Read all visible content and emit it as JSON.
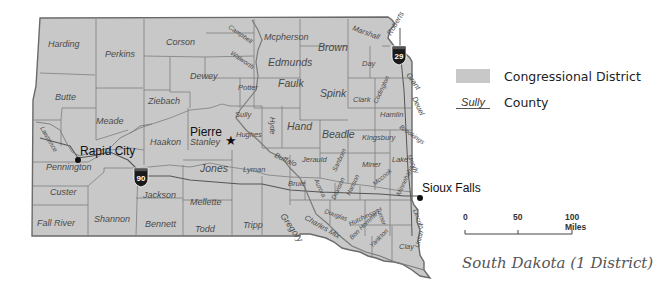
{
  "map": {
    "title": "South Dakota (1 District)",
    "fill_color": "#c8c8c8",
    "border_color": "#6a6a6a",
    "cities": [
      {
        "name": "Pierre",
        "symbol": "star",
        "capital": true
      },
      {
        "name": "Rapid City",
        "symbol": "dot"
      },
      {
        "name": "Sioux Falls",
        "symbol": "dot"
      }
    ],
    "interstates": [
      {
        "number": "29"
      },
      {
        "number": "90"
      }
    ],
    "counties": {
      "harding": "Harding",
      "perkins": "Perkins",
      "corson": "Corson",
      "campbell": "Campbell",
      "mcpherson": "Mcpherson",
      "brown": "Brown",
      "marshall": "Marshall",
      "roberts": "Roberts",
      "walworth": "Walworth",
      "edmunds": "Edmunds",
      "day": "Day",
      "grant": "Grant",
      "dewey": "Dewey",
      "butte": "Butte",
      "ziebach": "Ziebach",
      "potter": "Potter",
      "faulk": "Faulk",
      "spink": "Spink",
      "clark": "Clark",
      "codington": "Codington",
      "deuel": "Deuel",
      "meade": "Meade",
      "sully": "Sully",
      "hyde": "Hyde",
      "hand": "Hand",
      "hamlin": "Hamlin",
      "lawrence": "Lawrence",
      "haakon": "Haakon",
      "stanley": "Stanley",
      "hughes": "Hughes",
      "beadle": "Beadle",
      "kingsbury": "Kingsbury",
      "brookings": "Brookings",
      "pennington": "Pennington",
      "jones": "Jones",
      "lyman": "Lyman",
      "buffalo": "Buffalo",
      "jerauld": "Jerauld",
      "sanborn": "Sanborn",
      "miner": "Miner",
      "lake": "Lake",
      "moody": "Moody",
      "custer": "Custer",
      "jackson": "Jackson",
      "brule": "Brule",
      "aurora": "Aurora",
      "davison": "Davison",
      "hanson": "Hanson",
      "mccook": "Mccook",
      "minnehaha": "Minnehaha",
      "mellette": "Mellette",
      "douglas": "Douglas",
      "hutchinson": "Hutchinson",
      "turner": "Turner",
      "lincoln": "Lincoln",
      "fall_river": "Fall River",
      "shannon": "Shannon",
      "bennett": "Bennett",
      "todd": "Todd",
      "tripp": "Tripp",
      "gregory": "Gregory",
      "charles_mix": "Charles Mix",
      "bon_homme": "Bon Homme",
      "yankton": "Yankton",
      "clay": "Clay",
      "union": "Union"
    }
  },
  "legend": {
    "district_label": "Congressional District",
    "county_sample": "Sully",
    "county_label": "County"
  },
  "scale": {
    "ticks": [
      "0",
      "50",
      "100 Miles"
    ]
  }
}
